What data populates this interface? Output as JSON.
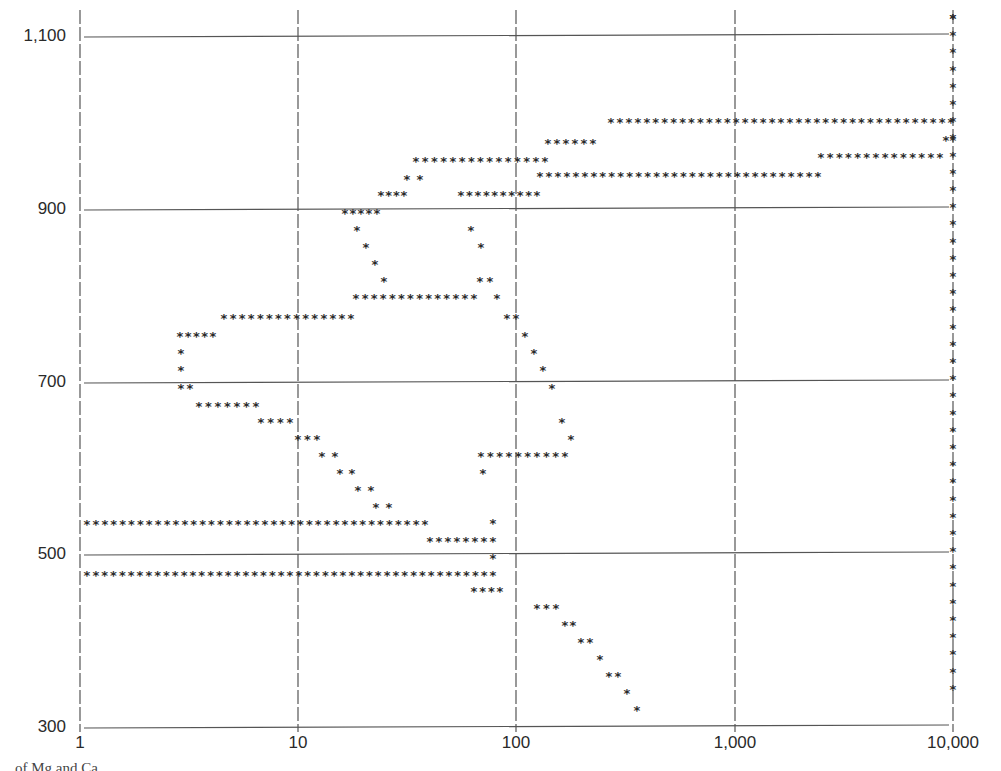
{
  "chart_data": {
    "type": "scatter",
    "title": "",
    "xlabel": "",
    "ylabel": "",
    "xscale": "log",
    "xlim": [
      1,
      10000
    ],
    "ylim": [
      300,
      1100
    ],
    "grid": true,
    "legend": null,
    "marker": "asterisk",
    "x_ticks": [
      "1",
      "10",
      "100",
      "1,000",
      "10,000"
    ],
    "y_ticks": [
      "300",
      "500",
      "700",
      "900",
      "1,100"
    ],
    "x_tick_values": [
      1,
      10,
      100,
      1000,
      10000
    ],
    "y_tick_values": [
      300,
      500,
      700,
      900,
      1100
    ],
    "pixel_mapping": {
      "x_px_at_1": 80,
      "px_per_decade": 218.3,
      "y_px_at_300": 728,
      "px_per_100": 86.5
    },
    "runs": [
      {
        "y_px": 18,
        "segments": [
          [
            953,
            953
          ]
        ]
      },
      {
        "y_px": 122,
        "segments": [
          [
            611,
            951
          ]
        ]
      },
      {
        "y_px": 140,
        "segments": [
          [
            946,
            953
          ]
        ]
      },
      {
        "y_px": 143,
        "segments": [
          [
            548,
            593
          ]
        ]
      },
      {
        "y_px": 157,
        "segments": [
          [
            821,
            940
          ]
        ]
      },
      {
        "y_px": 161,
        "segments": [
          [
            416,
            545
          ]
        ]
      },
      {
        "y_px": 176,
        "segments": [
          [
            540,
            818
          ]
        ]
      },
      {
        "y_px": 179,
        "segments": [
          [
            407,
            420
          ]
        ]
      },
      {
        "y_px": 195,
        "segments": [
          [
            381,
            404
          ],
          [
            461,
            537
          ]
        ]
      },
      {
        "y_px": 213,
        "segments": [
          [
            345,
            377
          ]
        ]
      },
      {
        "y_px": 230,
        "segments": [
          [
            357,
            357
          ],
          [
            471,
            471
          ]
        ]
      },
      {
        "y_px": 247,
        "segments": [
          [
            366,
            366
          ],
          [
            481,
            481
          ]
        ]
      },
      {
        "y_px": 264,
        "segments": [
          [
            375,
            375
          ]
        ]
      },
      {
        "y_px": 281,
        "segments": [
          [
            384,
            384
          ],
          [
            480,
            490
          ]
        ]
      },
      {
        "y_px": 298,
        "segments": [
          [
            356,
            474
          ],
          [
            497,
            497
          ]
        ]
      },
      {
        "y_px": 318,
        "segments": [
          [
            224,
            351
          ],
          [
            507,
            516
          ]
        ]
      },
      {
        "y_px": 336,
        "segments": [
          [
            180,
            213
          ],
          [
            525,
            525
          ]
        ]
      },
      {
        "y_px": 353,
        "segments": [
          [
            181,
            181
          ],
          [
            534,
            534
          ]
        ]
      },
      {
        "y_px": 370,
        "segments": [
          [
            181,
            181
          ],
          [
            543,
            543
          ]
        ]
      },
      {
        "y_px": 388,
        "segments": [
          [
            181,
            190
          ],
          [
            552,
            552
          ]
        ]
      },
      {
        "y_px": 406,
        "segments": [
          [
            199,
            256
          ]
        ]
      },
      {
        "y_px": 422,
        "segments": [
          [
            261,
            290
          ],
          [
            562,
            562
          ]
        ]
      },
      {
        "y_px": 439,
        "segments": [
          [
            298,
            317
          ],
          [
            571,
            571
          ]
        ]
      },
      {
        "y_px": 456,
        "segments": [
          [
            322,
            335
          ],
          [
            481,
            565
          ]
        ]
      },
      {
        "y_px": 473,
        "segments": [
          [
            340,
            352
          ],
          [
            483,
            483
          ]
        ]
      },
      {
        "y_px": 490,
        "segments": [
          [
            358,
            371
          ]
        ]
      },
      {
        "y_px": 507,
        "segments": [
          [
            376,
            389
          ]
        ]
      },
      {
        "y_px": 524,
        "segments": [
          [
            87,
            425
          ]
        ]
      },
      {
        "y_px": 523,
        "segments": [
          [
            493,
            493
          ]
        ]
      },
      {
        "y_px": 541,
        "segments": [
          [
            430,
            493
          ]
        ]
      },
      {
        "y_px": 558,
        "segments": [
          [
            493,
            493
          ]
        ]
      },
      {
        "y_px": 575,
        "segments": [
          [
            87,
            493
          ]
        ]
      },
      {
        "y_px": 591,
        "segments": [
          [
            474,
            500
          ]
        ]
      },
      {
        "y_px": 608,
        "segments": [
          [
            537,
            556
          ]
        ]
      },
      {
        "y_px": 625,
        "segments": [
          [
            565,
            573
          ]
        ]
      },
      {
        "y_px": 642,
        "segments": [
          [
            581,
            590
          ]
        ]
      },
      {
        "y_px": 659,
        "segments": [
          [
            600,
            600
          ]
        ]
      },
      {
        "y_px": 676,
        "segments": [
          [
            609,
            618
          ]
        ]
      },
      {
        "y_px": 693,
        "segments": [
          [
            627,
            627
          ]
        ]
      },
      {
        "y_px": 710,
        "segments": [
          [
            637,
            637
          ]
        ]
      }
    ],
    "right_column": {
      "x_px": 953,
      "y_px_start": 18,
      "y_px_end": 705,
      "step": 17.2
    }
  },
  "axes": {
    "y_labels": [
      {
        "text": "1,100",
        "y": 37
      },
      {
        "text": "900",
        "y": 210
      },
      {
        "text": "700",
        "y": 383
      },
      {
        "text": "500",
        "y": 555
      },
      {
        "text": "300",
        "y": 728
      }
    ],
    "x_labels": [
      {
        "text": "1",
        "x": 80
      },
      {
        "text": "10",
        "x": 298
      },
      {
        "text": "100",
        "x": 516
      },
      {
        "text": "1,000",
        "x": 735
      },
      {
        "text": "10,000",
        "x": 953
      }
    ]
  },
  "caption": {
    "text": "... of Mg and Ca"
  },
  "colors": {
    "ink": "#2a2a2a",
    "grid": "#555555",
    "background": "#ffffff"
  }
}
